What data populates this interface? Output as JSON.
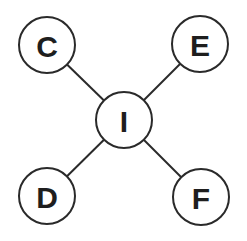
{
  "diagram": {
    "type": "star-graph",
    "center": {
      "id": "I",
      "label": "I",
      "x": 124,
      "y": 120
    },
    "nodes": [
      {
        "id": "C",
        "label": "C",
        "x": 47,
        "y": 45
      },
      {
        "id": "E",
        "label": "E",
        "x": 200,
        "y": 44
      },
      {
        "id": "D",
        "label": "D",
        "x": 47,
        "y": 196
      },
      {
        "id": "F",
        "label": "F",
        "x": 201,
        "y": 197
      }
    ],
    "edges": [
      [
        "I",
        "C"
      ],
      [
        "I",
        "E"
      ],
      [
        "I",
        "D"
      ],
      [
        "I",
        "F"
      ]
    ],
    "radius": 28,
    "colors": {
      "stroke": "#2a2a2a",
      "text": "#1e1e1e",
      "background": "#ffffff"
    }
  }
}
